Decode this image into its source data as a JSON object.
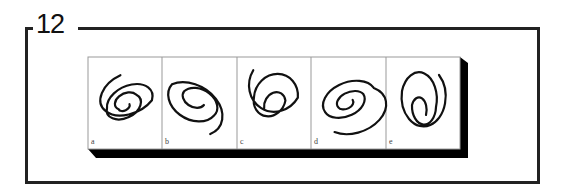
{
  "figure": {
    "number": "12",
    "panels": [
      {
        "label": "a",
        "description": "spiral, clockwise-tilted, open arc at top right"
      },
      {
        "label": "b",
        "description": "spiral, open arc trailing to lower right"
      },
      {
        "label": "c",
        "description": "spiral, open arc trailing to left"
      },
      {
        "label": "d",
        "description": "spiral, open arc trailing to lower left, with gap"
      },
      {
        "label": "e",
        "description": "vertical oval spiral, open arc at top right"
      }
    ],
    "colors": {
      "frame": "#222222",
      "shadow": "#000000",
      "panel_border": "#999999",
      "stroke": "#111111"
    }
  }
}
